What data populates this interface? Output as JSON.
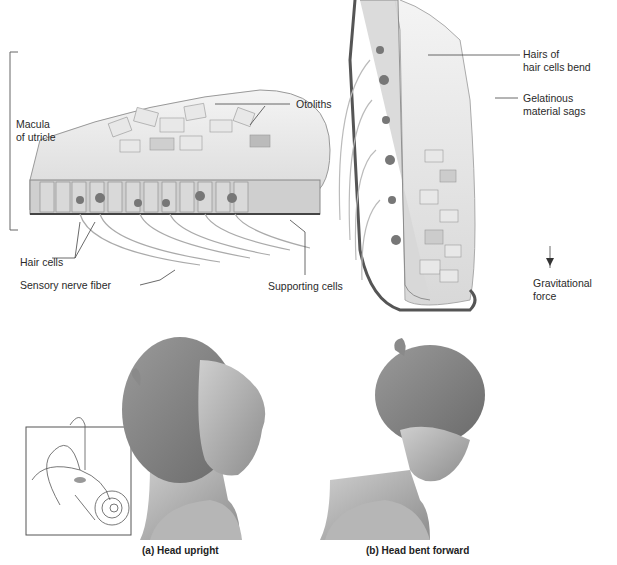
{
  "panel_a_micro": {
    "labels": {
      "macula": "Macula\nof utricle",
      "otoliths": "Otoliths",
      "hair_cells": "Hair cells",
      "sensory_nerve": "Sensory nerve fiber",
      "supporting_cells": "Supporting cells"
    }
  },
  "panel_b_micro": {
    "labels": {
      "hairs_bend": "Hairs of\nhair cells bend",
      "gelatinous": "Gelatinous\nmaterial sags",
      "gravity": "Gravitational\nforce"
    }
  },
  "captions": {
    "a": "(a) Head upright",
    "b": "(b) Head bent forward"
  },
  "inset": {
    "description": "inner ear inset with utricle highlighted"
  }
}
